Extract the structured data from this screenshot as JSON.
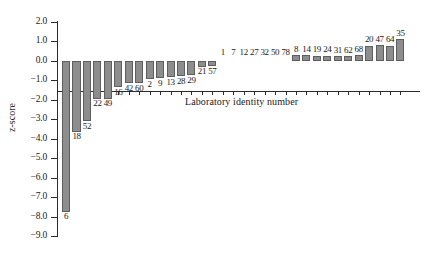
{
  "chart_data": {
    "type": "bar",
    "title": "",
    "xlabel": "Laboratory identity number",
    "ylabel": "z-score",
    "ylim": [
      -9.0,
      2.0
    ],
    "ytick_labels": [
      "2.0",
      "1.0",
      "0.0",
      "-1.0",
      "-2.0",
      "-3.0",
      "-4.0",
      "-5.0",
      "-6.0",
      "-7.0",
      "-8.0",
      "-9.0"
    ],
    "ytick_values": [
      2.0,
      1.0,
      0.0,
      -1.0,
      -2.0,
      -3.0,
      -4.0,
      -5.0,
      -6.0,
      -7.0,
      -8.0,
      -9.0
    ],
    "grid": false,
    "legend": null,
    "categories": [
      "6",
      "18",
      "52",
      "22",
      "49",
      "16",
      "42",
      "60",
      "2",
      "9",
      "13",
      "28",
      "29",
      "21",
      "57",
      "1",
      "7",
      "12",
      "27",
      "32",
      "50",
      "78",
      "8",
      "14",
      "19",
      "24",
      "31",
      "62",
      "68",
      "20",
      "47",
      "64",
      "35"
    ],
    "values": [
      -7.75,
      -3.65,
      -3.1,
      -1.95,
      -1.95,
      -1.35,
      -1.15,
      -1.15,
      -0.95,
      -0.9,
      -0.85,
      -0.8,
      -0.75,
      -0.3,
      -0.28,
      -0.05,
      -0.04,
      -0.03,
      -0.02,
      -0.02,
      -0.01,
      -0.01,
      0.3,
      0.28,
      0.26,
      0.26,
      0.25,
      0.24,
      0.28,
      0.78,
      0.8,
      0.78,
      1.12
    ],
    "bar_color": "#8d8d8d",
    "bar_edge_color": "#5e5e5e",
    "axis_color": "#2b2b2b"
  }
}
